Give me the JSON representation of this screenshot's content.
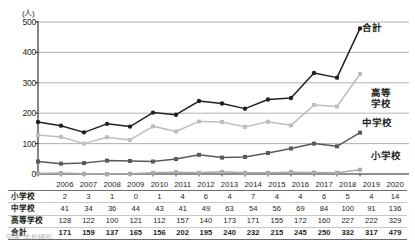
{
  "chart_data": {
    "type": "line",
    "title": "",
    "xlabel": "",
    "ylabel": "(人)",
    "unit_label": "(人)",
    "x": [
      2006,
      2007,
      2008,
      2009,
      2010,
      2011,
      2012,
      2013,
      2014,
      2015,
      2016,
      2017,
      2018,
      2019,
      2020
    ],
    "categories": [
      "2006",
      "2007",
      "2008",
      "2009",
      "2010",
      "2011",
      "2012",
      "2013",
      "2014",
      "2015",
      "2016",
      "2017",
      "2018",
      "2019",
      "2020"
    ],
    "ylim": [
      0,
      500
    ],
    "yticks": [
      0,
      100,
      200,
      300,
      400,
      500
    ],
    "ytick_labels": [
      "0",
      "100",
      "200",
      "300",
      "400",
      "500"
    ],
    "grid": true,
    "grid_axis": "y",
    "legend_position": "inline-right",
    "series": [
      {
        "name": "合計",
        "color": "#231f20",
        "marker": "circle",
        "values": [
          171,
          159,
          137,
          165,
          156,
          202,
          195,
          240,
          232,
          215,
          245,
          250,
          332,
          317,
          479
        ]
      },
      {
        "name": "高等学校",
        "color": "#bcbec0",
        "marker": "square",
        "values": [
          128,
          122,
          100,
          121,
          112,
          157,
          140,
          173,
          171,
          155,
          172,
          160,
          227,
          222,
          329
        ]
      },
      {
        "name": "中学校",
        "color": "#58595b",
        "marker": "square",
        "values": [
          41,
          34,
          36,
          44,
          43,
          41,
          49,
          63,
          54,
          56,
          69,
          84,
          100,
          91,
          136
        ]
      },
      {
        "name": "小学校",
        "color": "#a7a9ac",
        "marker": "square",
        "values": [
          2,
          3,
          1,
          0,
          1,
          4,
          6,
          4,
          7,
          4,
          4,
          6,
          5,
          4,
          14
        ]
      }
    ],
    "annotations": [
      {
        "text": "合計",
        "series": "合計"
      },
      {
        "text": "高等\n学校",
        "series": "高等学校"
      },
      {
        "text": "中学校",
        "series": "中学校"
      },
      {
        "text": "小学校",
        "series": "小学校"
      }
    ]
  },
  "series_labels": {
    "total": "合計",
    "high_line1": "高等",
    "high_line2": "学校",
    "junior": "中学校",
    "elementary": "小学校"
  },
  "table": {
    "corner_header": "",
    "columns": [
      "2006",
      "2007",
      "2008",
      "2009",
      "2010",
      "2011",
      "2012",
      "2013",
      "2014",
      "2015",
      "2016",
      "2017",
      "2018",
      "2019",
      "2020"
    ],
    "rows": [
      {
        "label": "小学校",
        "values": [
          "2",
          "3",
          "1",
          "0",
          "1",
          "4",
          "6",
          "4",
          "7",
          "4",
          "4",
          "6",
          "5",
          "4",
          "14"
        ]
      },
      {
        "label": "中学校",
        "values": [
          "41",
          "34",
          "36",
          "44",
          "43",
          "41",
          "49",
          "63",
          "54",
          "56",
          "69",
          "84",
          "100",
          "91",
          "136"
        ]
      },
      {
        "label": "高等学校",
        "values": [
          "128",
          "122",
          "100",
          "121",
          "112",
          "157",
          "140",
          "173",
          "171",
          "155",
          "172",
          "160",
          "227",
          "222",
          "329"
        ]
      },
      {
        "label": "合計",
        "values": [
          "171",
          "159",
          "137",
          "165",
          "156",
          "202",
          "195",
          "240",
          "232",
          "215",
          "245",
          "250",
          "332",
          "317",
          "479"
        ]
      }
    ]
  },
  "caption": "図表  学校種別",
  "colors": {
    "total": "#231f20",
    "high_school": "#bcbec0",
    "junior_high": "#58595b",
    "elementary": "#a7a9ac",
    "axis": "#231f20",
    "gridline": "#a7a9ac"
  }
}
